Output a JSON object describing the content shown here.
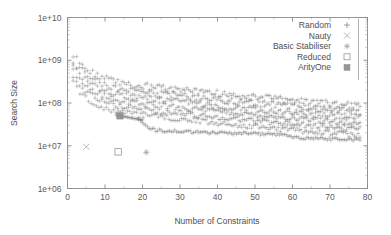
{
  "chart_data": {
    "type": "scatter",
    "title": "",
    "xlabel": "Number of Constraints",
    "ylabel": "Search Size",
    "xlim": [
      0,
      80
    ],
    "ylim": [
      1000000,
      10000000000
    ],
    "yscale": "log",
    "xscale": "linear",
    "grid": false,
    "legend_position": "top-right",
    "xticks": [
      "0",
      "10",
      "20",
      "30",
      "40",
      "50",
      "60",
      "70",
      "80"
    ],
    "xtick_values": [
      0,
      10,
      20,
      30,
      40,
      50,
      60,
      70,
      80
    ],
    "yticks": [
      "1e+06",
      "1e+07",
      "1e+08",
      "1e+09",
      "1e+10"
    ],
    "ytick_values": [
      1000000,
      10000000,
      100000000,
      1000000000,
      10000000000
    ],
    "series": [
      {
        "name": "Random",
        "marker": "plus",
        "color": "#7d7d7d",
        "points": [
          [
            1.5,
            900000000.0
          ],
          [
            2.0,
            760000000.0
          ],
          [
            2.5,
            680000000.0
          ],
          [
            3.0,
            600000000.0
          ],
          [
            3.5,
            540000000.0
          ],
          [
            4.0,
            500000000.0
          ],
          [
            4.5,
            460000000.0
          ],
          [
            5.0,
            420000000.0
          ],
          [
            5.5,
            390000000.0
          ],
          [
            6.0,
            360000000.0
          ],
          [
            6.5,
            340000000.0
          ],
          [
            7.0,
            320000000.0
          ],
          [
            7.5,
            300000000.0
          ],
          [
            8.0,
            285000000.0
          ],
          [
            8.5,
            270000000.0
          ],
          [
            9.0,
            260000000.0
          ],
          [
            9.5,
            250000000.0
          ],
          [
            10.0,
            240000000.0
          ],
          [
            11.0,
            225000000.0
          ],
          [
            12.0,
            210000000.0
          ],
          [
            13.0,
            200000000.0
          ],
          [
            14.0,
            192000000.0
          ],
          [
            15.0,
            185000000.0
          ],
          [
            16.0,
            180000000.0
          ],
          [
            17.0,
            174000000.0
          ],
          [
            18.0,
            170000000.0
          ],
          [
            19.0,
            166000000.0
          ],
          [
            20.0,
            162000000.0
          ],
          [
            22.0,
            155000000.0
          ],
          [
            24.0,
            148000000.0
          ],
          [
            26.0,
            142000000.0
          ],
          [
            28.0,
            136000000.0
          ],
          [
            30.0,
            130000000.0
          ],
          [
            32.0,
            125000000.0
          ],
          [
            34.0,
            120000000.0
          ],
          [
            36.0,
            115000000.0
          ],
          [
            38.0,
            110000000.0
          ],
          [
            40.0,
            106000000.0
          ],
          [
            42.0,
            102000000.0
          ],
          [
            44.0,
            98000000.0
          ],
          [
            46.0,
            94000000.0
          ],
          [
            48.0,
            91000000.0
          ],
          [
            50.0,
            88000000.0
          ],
          [
            52.0,
            85000000.0
          ],
          [
            54.0,
            82000000.0
          ],
          [
            56.0,
            79000000.0
          ],
          [
            58.0,
            76000000.0
          ],
          [
            60.0,
            74000000.0
          ],
          [
            62.0,
            71000000.0
          ],
          [
            64.0,
            69000000.0
          ],
          [
            66.0,
            67000000.0
          ],
          [
            68.0,
            65000000.0
          ],
          [
            70.0,
            63000000.0
          ],
          [
            72.0,
            61000000.0
          ],
          [
            74.0,
            59000000.0
          ],
          [
            76.0,
            57000000.0
          ],
          [
            78.0,
            55000000.0
          ]
        ]
      },
      {
        "name": "Nauty",
        "marker": "cross",
        "color": "#9a9a9a",
        "points": [
          [
            5.0,
            9500000.0
          ]
        ]
      },
      {
        "name": "Basic Stabiliser",
        "marker": "star",
        "color": "#9a9a9a",
        "points": [
          [
            21.0,
            7000000.0
          ]
        ]
      },
      {
        "name": "Reduced",
        "marker": "open-square",
        "color": "#8a8a8a",
        "points": [
          [
            13.5,
            7200000.0
          ]
        ]
      },
      {
        "name": "ArityOne",
        "marker": "filled-square",
        "color": "#8f8f8f",
        "points": [
          [
            14.0,
            50000000.0
          ]
        ]
      }
    ],
    "lower_branch_note": "secondary cluster of plus markers descending from 4e7 near x=20 to 1.4e7 near x=78"
  },
  "legend": {
    "entries": [
      {
        "label": "Random",
        "marker": "plus"
      },
      {
        "label": "Nauty",
        "marker": "cross"
      },
      {
        "label": "Basic Stabiliser",
        "marker": "star"
      },
      {
        "label": "Reduced",
        "marker": "open-square"
      },
      {
        "label": "ArityOne",
        "marker": "filled-square"
      }
    ]
  },
  "axes": {
    "x_title": "Number of Constraints",
    "y_title": "Search Size"
  }
}
